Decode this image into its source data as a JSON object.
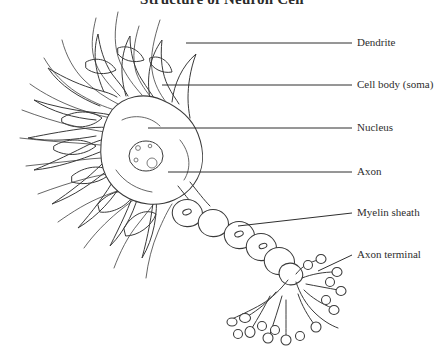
{
  "figure": {
    "title": "Structure of Neuron Cell",
    "type": "labeled-biological-diagram",
    "subject": "neuron",
    "style": "black-and-white line drawing",
    "background_color": "#ffffff",
    "ink_color": "#3a3a3a",
    "text_color": "#2e2e2e"
  },
  "labels": [
    {
      "id": "dendrite",
      "text": "Dendrite",
      "text_x": 357,
      "text_y": 37,
      "leader_from_x": 186,
      "leader_from_y": 43,
      "leader_to_x": 352,
      "leader_to_y": 43
    },
    {
      "id": "cell-body-soma",
      "text": "Cell body (soma)",
      "text_x": 357,
      "text_y": 79,
      "leader_from_x": 162,
      "leader_from_y": 85,
      "leader_to_x": 352,
      "leader_to_y": 85
    },
    {
      "id": "nucleus",
      "text": "Nucleus",
      "text_x": 357,
      "text_y": 122,
      "leader_from_x": 148,
      "leader_from_y": 128,
      "leader_to_x": 352,
      "leader_to_y": 128
    },
    {
      "id": "axon",
      "text": "Axon",
      "text_x": 357,
      "text_y": 166,
      "leader_from_x": 168,
      "leader_from_y": 172,
      "leader_to_x": 352,
      "leader_to_y": 172
    },
    {
      "id": "myelin-sheath",
      "text": "Myelin sheath",
      "text_x": 357,
      "text_y": 207,
      "leader_from_x": 238,
      "leader_from_y": 226,
      "leader_to_x": 352,
      "leader_to_y": 213
    },
    {
      "id": "axon-terminal",
      "text": "Axon terminal",
      "text_x": 357,
      "text_y": 249,
      "leader_from_x": 318,
      "leader_from_y": 271,
      "leader_to_x": 352,
      "leader_to_y": 255
    }
  ],
  "parts": {
    "soma": {
      "name": "cell body (soma)",
      "center_x": 150,
      "center_y": 160
    },
    "nucleus": {
      "name": "nucleus",
      "center_x": 146,
      "center_y": 156,
      "rx": 17,
      "ry": 15
    },
    "dendrites": {
      "name": "dendrites",
      "count_branches": 40,
      "region": "upper-left of soma"
    },
    "axon": {
      "name": "axon",
      "from_x": 180,
      "from_y": 190,
      "to_x": 268,
      "to_y": 278
    },
    "myelin_sheath": {
      "name": "myelin sheath",
      "segment_count": 6
    },
    "axon_terminal": {
      "name": "axon terminal",
      "bouton_count": 17
    }
  }
}
